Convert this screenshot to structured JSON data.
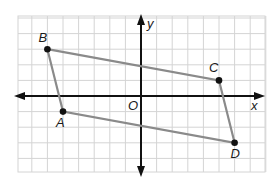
{
  "figure": {
    "grid": {
      "x_min": -8,
      "x_max": 8,
      "y_min": -5,
      "y_max": 5,
      "unit_px": 15.6,
      "origin_px": [
        141,
        96
      ]
    },
    "axes": {
      "x_label": "x",
      "y_label": "y",
      "origin_label": "O"
    },
    "points": [
      {
        "name": "B",
        "x": -6,
        "y": 3
      },
      {
        "name": "C",
        "x": 5,
        "y": 1
      },
      {
        "name": "D",
        "x": 6,
        "y": -3
      },
      {
        "name": "A",
        "x": -5,
        "y": -1
      }
    ],
    "colors": {
      "grid": "#d4d4d4",
      "axis": "#111111",
      "polygon": "#8a8a8a",
      "point": "#111111"
    }
  }
}
